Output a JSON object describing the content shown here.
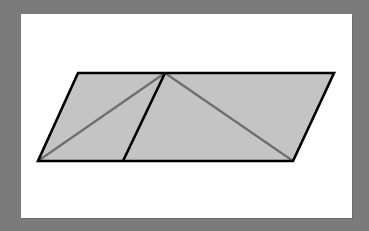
{
  "diagram": {
    "title": "",
    "colors": {
      "background": "#7b7b7b",
      "panel": "#ffffff",
      "fill": "#c4c4c4",
      "outline": "#000000",
      "diagonal": "#6e6e6e"
    },
    "vertices": {
      "top_left": [
        78,
        73
      ],
      "top_mid": [
        165,
        73
      ],
      "top_right": [
        334,
        73
      ],
      "bottom_left": [
        38,
        161
      ],
      "bottom_mid": [
        123,
        161
      ],
      "bottom_right": [
        293,
        161
      ]
    },
    "segments": [
      {
        "name": "divider",
        "from": "top_mid",
        "to": "bottom_mid",
        "style": "outline"
      },
      {
        "name": "left-diagonal",
        "from": "bottom_left",
        "to": "top_mid",
        "style": "diagonal"
      },
      {
        "name": "right-diagonal",
        "from": "top_mid",
        "to": "bottom_right",
        "style": "diagonal"
      }
    ]
  }
}
